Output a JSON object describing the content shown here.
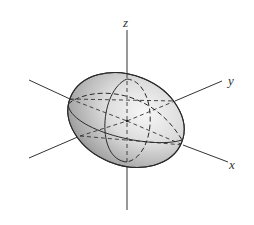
{
  "figure": {
    "type": "3d-ellipsoid",
    "axes": {
      "x": {
        "label": "x"
      },
      "y": {
        "label": "y"
      },
      "z": {
        "label": "z"
      }
    },
    "colors": {
      "axis_line": "#333333",
      "outline": "#2a2a2a",
      "shade_light": "#f4f4f4",
      "shade_mid": "#cfcfcf",
      "shade_dark": "#8c8c8c",
      "background": "#ffffff"
    },
    "curves": {
      "horizontal_cross_section": "xy-plane ellipse (front half solid, back half dashed)",
      "vertical_cross_section": "xz-plane ellipse (front half solid, back half dashed)",
      "hidden_axes": "dashed inside ellipsoid"
    }
  }
}
